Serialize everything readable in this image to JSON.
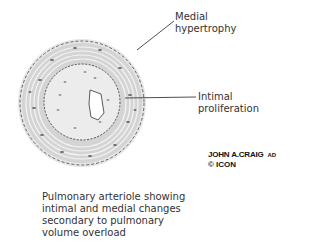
{
  "labels": {
    "medial": [
      "Medial",
      "hypertrophy"
    ],
    "intimal": [
      "Intimal",
      "proliferation"
    ]
  },
  "caption": [
    "Pulmonary arteriole showing",
    "intimal and medial changes",
    "secondary to pulmonary",
    "volume overload"
  ],
  "signature": {
    "name": "JOHN A.CRAIG",
    "suffix": "AD",
    "logo": "© ICON"
  },
  "colors": {
    "wall": "#c8c8c8",
    "nuclei": "#6a6a6a",
    "lines": "#222222"
  }
}
